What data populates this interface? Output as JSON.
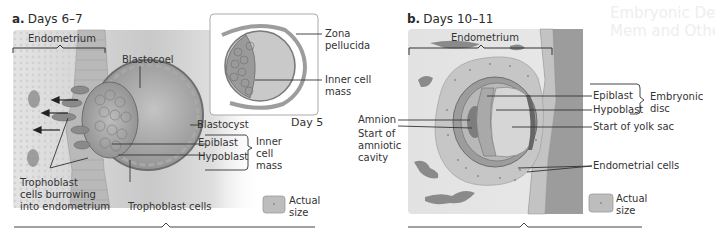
{
  "background_ghost_text": [
    "Embryonic Dev",
    "Mem and Other"
  ],
  "panel_a": {
    "letter": "a.",
    "title": "Days 6–7",
    "labels": {
      "endometrium": "Endometrium",
      "blastocoel": "Blastocoel",
      "blastocyst": "Blastocyst",
      "epiblast": "Epiblast",
      "hypoblast": "Hypoblast",
      "inner_cell_mass": [
        "Inner",
        "cell",
        "mass"
      ],
      "trophoblast_burrowing": [
        "Trophoblast",
        "cells burrowing",
        "into endometrium"
      ],
      "trophoblast_cells": "Trophoblast cells",
      "actual_size": [
        "Actual",
        "size"
      ]
    },
    "inset": {
      "caption": "Day 5",
      "zona_pellucida": [
        "Zona",
        "pellucida"
      ],
      "inner_cell_mass": [
        "Inner cell",
        "mass"
      ]
    }
  },
  "panel_b": {
    "letter": "b.",
    "title": "Days 10–11",
    "labels": {
      "endometrium": "Endometrium",
      "amnion": "Amnion",
      "start_amniotic_cavity": [
        "Start of",
        "amniotic",
        "cavity"
      ],
      "epiblast": "Epiblast",
      "hypoblast": "Hypoblast",
      "embryonic_disc": [
        "Embryonic",
        "disc"
      ],
      "start_yolk_sac": "Start of yolk sac",
      "endometrial_cells": "Endometrial cells",
      "actual_size": [
        "Actual",
        "size"
      ]
    }
  },
  "colors": {
    "tissue_light": "#dcdcdc",
    "tissue_mid": "#b5b5b5",
    "tissue_dark": "#8a8a8a",
    "line": "#333333",
    "panel_bg": "#d6d6d6"
  }
}
